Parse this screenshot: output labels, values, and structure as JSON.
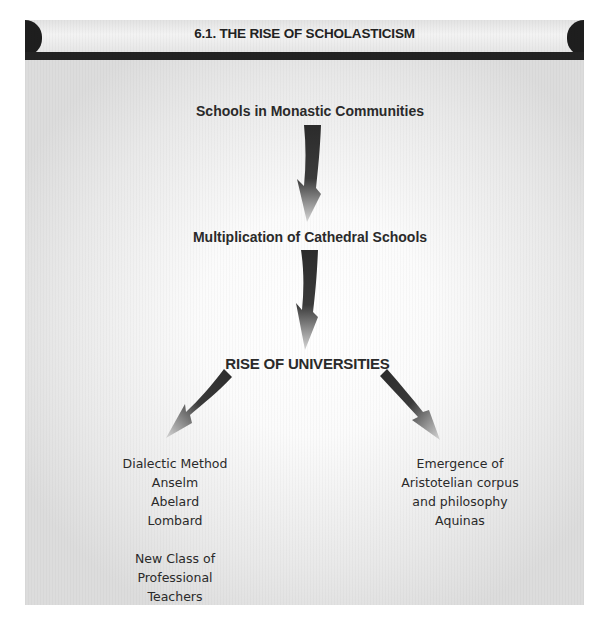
{
  "header": {
    "title": "6.1. THE RISE OF SCHOLASTICISM"
  },
  "diagram": {
    "nodes": {
      "monastic": "Schools in Monastic Communities",
      "cathedral": "Multiplication of Cathedral Schools",
      "universities": "RISE OF UNIVERSITIES",
      "left_branch": {
        "lines": [
          "Dialectic Method",
          "Anselm",
          "Abelard",
          "Lombard"
        ],
        "lines2": [
          "New Class of",
          "Professional",
          "Teachers"
        ]
      },
      "right_branch": {
        "lines": [
          "Emergence of",
          "Aristotelian corpus",
          "and philosophy",
          "Aquinas"
        ]
      }
    },
    "edges": [
      {
        "from": "Schools in Monastic Communities",
        "to": "Multiplication of Cathedral Schools"
      },
      {
        "from": "Multiplication of Cathedral Schools",
        "to": "RISE OF UNIVERSITIES"
      },
      {
        "from": "RISE OF UNIVERSITIES",
        "to": "Dialectic Method / New Class of Professional Teachers"
      },
      {
        "from": "RISE OF UNIVERSITIES",
        "to": "Emergence of Aristotelian corpus and philosophy"
      }
    ],
    "colors": {
      "arrow_dark": "#2a2a2a",
      "arrow_light": "#d0d0d0",
      "header_band": "#232323"
    }
  }
}
